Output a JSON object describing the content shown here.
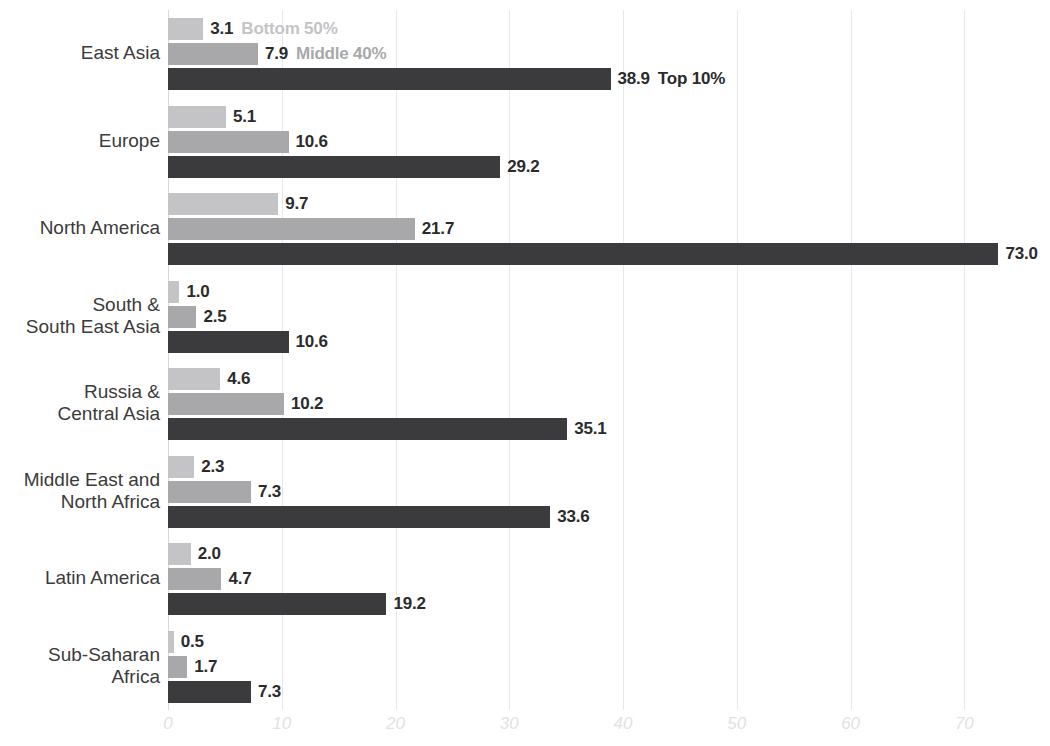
{
  "chart_data": {
    "type": "bar",
    "orientation": "horizontal",
    "title": "",
    "subtitle": "",
    "xlabel": "",
    "ylabel": "",
    "xlim": [
      0,
      77
    ],
    "grid": true,
    "gridlines_x": [
      0,
      10,
      20,
      30,
      40,
      50,
      60,
      70
    ],
    "xtick_labels": [
      "0",
      "10",
      "20",
      "30",
      "40",
      "50",
      "60",
      "70"
    ],
    "legend_position": "inline-first-group",
    "categories": [
      "East Asia",
      "Europe",
      "North America",
      "South &\nSouth East Asia",
      "Russia &\nCentral Asia",
      "Middle East and\nNorth Africa",
      "Latin America",
      "Sub-Saharan\nAfrica"
    ],
    "series": [
      {
        "name": "Bottom 50%",
        "color": "#c4c4c6",
        "values": [
          3.1,
          5.1,
          9.7,
          1.0,
          4.6,
          2.3,
          2.0,
          0.5
        ],
        "value_labels": [
          "3.1",
          "5.1",
          "9.7",
          "1.0",
          "4.6",
          "2.3",
          "2.0",
          "0.5"
        ]
      },
      {
        "name": "Middle 40%",
        "color": "#a8a8ab",
        "values": [
          7.9,
          10.6,
          21.7,
          2.5,
          10.2,
          7.3,
          4.7,
          1.7
        ],
        "value_labels": [
          "7.9",
          "10.6",
          "21.7",
          "2.5",
          "10.2",
          "7.3",
          "4.7",
          "1.7"
        ]
      },
      {
        "name": "Top 10%",
        "color": "#3b3b3d",
        "values": [
          38.9,
          29.2,
          73.0,
          10.6,
          35.1,
          33.6,
          19.2,
          7.3
        ],
        "value_labels": [
          "38.9",
          "29.2",
          "73.0",
          "10.6",
          "35.1",
          "33.6",
          "19.2",
          "7.3"
        ]
      }
    ]
  },
  "legend": {
    "items": [
      {
        "label": "Bottom 50%",
        "color": "#c4c4c6"
      },
      {
        "label": "Middle 40%",
        "color": "#a8a8ab"
      },
      {
        "label": "Top 10%",
        "color": "#2b2b2b"
      }
    ]
  },
  "colors": {
    "background": "#ffffff",
    "gridline": "#e8e8ea",
    "axis": "#d9d9dc",
    "value_text": "#2b2b2b",
    "category_text": "#3b3b3b",
    "tick_text": "#e2e2e4"
  }
}
